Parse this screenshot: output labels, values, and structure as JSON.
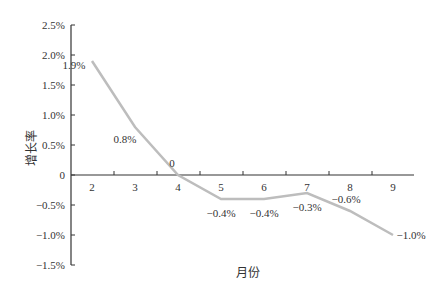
{
  "chart_data": {
    "type": "line",
    "title": "",
    "xlabel": "月份",
    "ylabel": "增长率",
    "categories": [
      "2",
      "3",
      "4",
      "5",
      "6",
      "7",
      "8",
      "9"
    ],
    "series": [
      {
        "name": "增长率",
        "values": [
          1.9,
          0.8,
          0.0,
          -0.4,
          -0.4,
          -0.3,
          -0.6,
          -1.0
        ],
        "labels": [
          "1.9%",
          "0.8%",
          "0",
          "−0.4%",
          "−0.4%",
          "−0.3%",
          "−0.6%",
          "−1.0%"
        ]
      }
    ],
    "yticks": [
      "2.5%",
      "2.0%",
      "1.5%",
      "1.0%",
      "0.5%",
      "0",
      "-0.5%",
      "-1.0%",
      "-1.5%"
    ],
    "ylim": [
      -1.5,
      2.5
    ],
    "grid": false,
    "line_color": "#bbbbbb"
  }
}
